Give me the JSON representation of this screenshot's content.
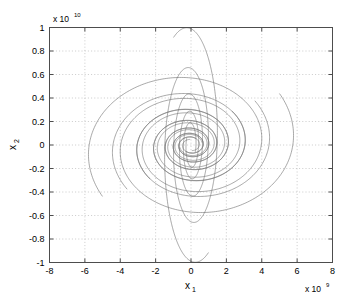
{
  "chart_data": {
    "type": "line",
    "title": "",
    "subtitle": "",
    "xlabel": "x_1",
    "ylabel": "x_2",
    "xlabel_base": "x",
    "xlabel_sub": "1",
    "ylabel_base": "x",
    "ylabel_sub": "2",
    "x_exponent_prefix": "x 10",
    "x_exponent_power": "9",
    "y_exponent_prefix": "x 10",
    "y_exponent_power": "10",
    "xlim": [
      -8,
      8
    ],
    "ylim": [
      -1,
      1
    ],
    "xticks": [
      -8,
      -6,
      -4,
      -2,
      0,
      2,
      4,
      6,
      8
    ],
    "xticklabels": [
      "-8",
      "-6",
      "-4",
      "-2",
      "0",
      "2",
      "4",
      "6",
      "8"
    ],
    "yticks": [
      -1,
      -0.8,
      -0.6,
      -0.4,
      -0.2,
      0,
      0.2,
      0.4,
      0.6,
      0.8,
      1
    ],
    "yticklabels": [
      "-1",
      "-0.8",
      "-0.6",
      "-0.4",
      "-0.2",
      "0",
      "0.2",
      "0.4",
      "0.6",
      "0.8",
      "1"
    ],
    "grid": true,
    "grid_style": "dotted",
    "grid_color": "#b4b4b4",
    "axes_color": "#4d4d4d",
    "legend": null,
    "legend_position": "none",
    "line_color": "#6e6e6e",
    "line_width": 0.6,
    "series": [
      {
        "name": "trajectory-1",
        "theta0_deg": 36,
        "r0_x": 6.2,
        "r0_y": 0.74,
        "decay": 0.118,
        "turns": 3.05,
        "direction": "clockwise"
      },
      {
        "name": "trajectory-2",
        "theta0_deg": 41,
        "r0_x": 4.8,
        "r0_y": 0.57,
        "decay": 0.118,
        "turns": 2.95,
        "direction": "clockwise"
      },
      {
        "name": "trajectory-3",
        "theta0_deg": 46,
        "r0_x": 3.35,
        "r0_y": 0.4,
        "decay": 0.118,
        "turns": 2.85,
        "direction": "clockwise"
      },
      {
        "name": "trajectory-4",
        "theta0_deg": 216,
        "r0_x": 6.2,
        "r0_y": 0.74,
        "decay": 0.118,
        "turns": 3.05,
        "direction": "clockwise"
      },
      {
        "name": "trajectory-5",
        "theta0_deg": 221,
        "r0_x": 4.8,
        "r0_y": 0.57,
        "decay": 0.118,
        "turns": 2.95,
        "direction": "clockwise"
      },
      {
        "name": "trajectory-6",
        "theta0_deg": 226,
        "r0_x": 3.35,
        "r0_y": 0.4,
        "decay": 0.118,
        "turns": 2.85,
        "direction": "clockwise"
      },
      {
        "name": "trajectory-7",
        "theta0_deg": 120,
        "r0_x": 1.95,
        "r0_y": 1.06,
        "decay": 0.132,
        "turns": 2.4,
        "direction": "clockwise"
      },
      {
        "name": "trajectory-8",
        "theta0_deg": 300,
        "r0_x": 1.95,
        "r0_y": 1.06,
        "decay": 0.132,
        "turns": 2.4,
        "direction": "clockwise"
      }
    ]
  }
}
